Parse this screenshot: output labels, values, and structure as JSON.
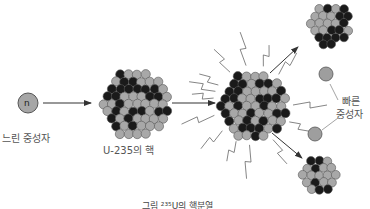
{
  "diagram": {
    "labels": {
      "slow_neutron": "느린 중성자",
      "neutron_symbol": "n",
      "u235_nucleus": "U-235의 핵",
      "fast_neutron_line1": "빠른",
      "fast_neutron_line2": "중성자",
      "caption": "그림 ²³⁵U의 핵분열"
    },
    "colors": {
      "proton": "#1a1a1a",
      "neutron": "#a8a8a8",
      "outline": "#555555",
      "arrow": "#333333",
      "free_neutron": "#9e9e9e"
    },
    "nodes": [
      {
        "id": "slow-neutron",
        "x": 28,
        "y": 103,
        "r": 10
      },
      {
        "id": "u235-nucleus",
        "x": 135,
        "y": 103,
        "r": 36
      },
      {
        "id": "excited-nucleus",
        "x": 253,
        "y": 105,
        "r": 36
      },
      {
        "id": "fragment-top",
        "x": 330,
        "y": 25,
        "r": 22
      },
      {
        "id": "fragment-bottom",
        "x": 320,
        "y": 175,
        "r": 20
      },
      {
        "id": "fast-neutron-1",
        "x": 326,
        "y": 74,
        "r": 7
      },
      {
        "id": "fast-neutron-2",
        "x": 315,
        "y": 134,
        "r": 7
      }
    ]
  }
}
